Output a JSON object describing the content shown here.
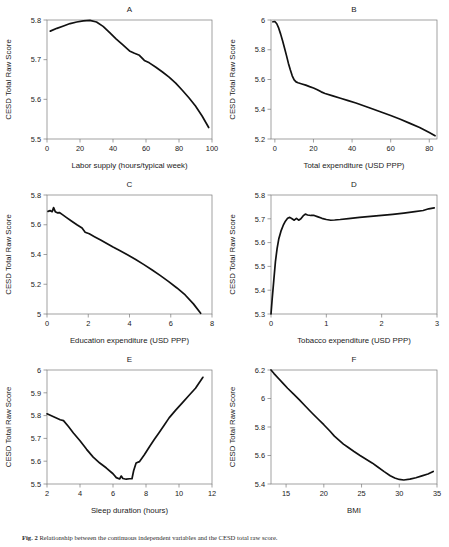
{
  "figure": {
    "caption_label": "Fig. 2",
    "caption_text": "Relationship between the continuous independent variables and the CESD total raw score."
  },
  "shared": {
    "ylabel": "CESD Total Raw Score"
  },
  "chart_data": [
    {
      "type": "line",
      "panel": "A",
      "title": "A",
      "xlabel": "Labor supply (hours/typical week)",
      "ylabel": "CESD Total Raw Score",
      "xlim": [
        0,
        100
      ],
      "ylim": [
        5.5,
        5.8
      ],
      "xticks": [
        0,
        20,
        40,
        60,
        80,
        100
      ],
      "yticks": [
        5.5,
        5.6,
        5.7,
        5.8
      ],
      "ytick_labels": [
        "5.5",
        "5.6",
        "5.7",
        "5.8"
      ],
      "grid": false,
      "legend": "none",
      "x": [
        2,
        6,
        10,
        14,
        18,
        22,
        26,
        30,
        34,
        38,
        42,
        46,
        50,
        53,
        56,
        59,
        62,
        66,
        70,
        74,
        78,
        82,
        86,
        90,
        94,
        98
      ],
      "y": [
        5.772,
        5.779,
        5.785,
        5.791,
        5.795,
        5.798,
        5.799,
        5.795,
        5.784,
        5.768,
        5.752,
        5.737,
        5.722,
        5.716,
        5.711,
        5.698,
        5.692,
        5.681,
        5.669,
        5.656,
        5.641,
        5.623,
        5.604,
        5.583,
        5.558,
        5.529
      ]
    },
    {
      "type": "line",
      "panel": "B",
      "title": "B",
      "xlabel": "Total expenditure (USD PPP)",
      "ylabel": "CESD Total Raw Score",
      "xlim": [
        -2,
        84
      ],
      "ylim": [
        5.2,
        6.0
      ],
      "xticks": [
        0,
        20,
        40,
        60,
        80
      ],
      "yticks": [
        5.2,
        5.4,
        5.6,
        5.8,
        6.0
      ],
      "ytick_labels": [
        "5.2",
        "5.4",
        "5.6",
        "5.8",
        "6"
      ],
      "grid": false,
      "legend": "none",
      "x": [
        -1,
        0,
        1,
        2,
        3,
        4,
        5,
        6,
        7,
        8,
        9,
        10,
        11,
        12,
        14,
        16,
        18,
        20,
        22,
        24,
        26,
        30,
        34,
        38,
        42,
        46,
        50,
        55,
        60,
        65,
        70,
        75,
        80,
        83
      ],
      "y": [
        5.988,
        5.99,
        5.975,
        5.945,
        5.905,
        5.86,
        5.812,
        5.762,
        5.71,
        5.665,
        5.625,
        5.598,
        5.584,
        5.578,
        5.57,
        5.562,
        5.552,
        5.543,
        5.531,
        5.517,
        5.506,
        5.49,
        5.474,
        5.458,
        5.442,
        5.424,
        5.405,
        5.382,
        5.358,
        5.333,
        5.305,
        5.277,
        5.243,
        5.222
      ]
    },
    {
      "type": "line",
      "panel": "C",
      "title": "C",
      "xlabel": "Education expenditure (USD PPP)",
      "ylabel": "CESD Total Raw Score",
      "xlim": [
        0,
        8
      ],
      "ylim": [
        5.0,
        5.8
      ],
      "xticks": [
        0,
        2,
        4,
        6,
        8
      ],
      "yticks": [
        5.0,
        5.2,
        5.4,
        5.6,
        5.8
      ],
      "ytick_labels": [
        "5",
        "5.2",
        "5.4",
        "5.6",
        "5.8"
      ],
      "grid": false,
      "legend": "none",
      "x": [
        0.05,
        0.15,
        0.25,
        0.32,
        0.4,
        0.5,
        0.6,
        0.75,
        0.95,
        1.2,
        1.45,
        1.7,
        1.85,
        2.05,
        2.3,
        2.6,
        2.9,
        3.2,
        3.5,
        3.9,
        4.3,
        4.7,
        5.1,
        5.5,
        5.9,
        6.3,
        6.7,
        7.1,
        7.45
      ],
      "y": [
        5.69,
        5.695,
        5.688,
        5.715,
        5.688,
        5.68,
        5.682,
        5.668,
        5.648,
        5.624,
        5.6,
        5.578,
        5.55,
        5.539,
        5.52,
        5.498,
        5.474,
        5.45,
        5.428,
        5.398,
        5.366,
        5.332,
        5.296,
        5.258,
        5.218,
        5.175,
        5.128,
        5.068,
        5.005
      ]
    },
    {
      "type": "line",
      "panel": "D",
      "title": "D",
      "xlabel": "Tobacco expenditure (USD PPP)",
      "ylabel": "CESD Total Raw Score",
      "xlim": [
        0,
        3
      ],
      "ylim": [
        5.3,
        5.8
      ],
      "xticks": [
        0,
        1,
        2,
        3
      ],
      "yticks": [
        5.3,
        5.4,
        5.5,
        5.6,
        5.7,
        5.8
      ],
      "ytick_labels": [
        "5.3",
        "5.4",
        "5.5",
        "5.6",
        "5.7",
        "5.8"
      ],
      "grid": false,
      "legend": "none",
      "x": [
        0.0,
        0.02,
        0.05,
        0.08,
        0.11,
        0.14,
        0.18,
        0.22,
        0.26,
        0.3,
        0.34,
        0.38,
        0.42,
        0.46,
        0.5,
        0.54,
        0.58,
        0.62,
        0.66,
        0.72,
        0.78,
        0.85,
        0.92,
        1.0,
        1.08,
        1.15,
        1.25,
        1.4,
        1.6,
        1.8,
        2.0,
        2.2,
        2.4,
        2.6,
        2.75,
        2.85,
        2.95
      ],
      "y": [
        5.3,
        5.36,
        5.44,
        5.52,
        5.575,
        5.615,
        5.648,
        5.672,
        5.69,
        5.702,
        5.706,
        5.7,
        5.694,
        5.702,
        5.694,
        5.7,
        5.712,
        5.72,
        5.716,
        5.714,
        5.714,
        5.708,
        5.702,
        5.697,
        5.694,
        5.695,
        5.697,
        5.701,
        5.706,
        5.71,
        5.714,
        5.719,
        5.724,
        5.73,
        5.735,
        5.742,
        5.746
      ]
    },
    {
      "type": "line",
      "panel": "E",
      "title": "E",
      "xlabel": "Sleep duration (hours)",
      "ylabel": "CESD Total Raw Score",
      "xlim": [
        2,
        12
      ],
      "ylim": [
        5.5,
        6.0
      ],
      "xticks": [
        2,
        4,
        6,
        8,
        10,
        12
      ],
      "yticks": [
        5.5,
        5.6,
        5.7,
        5.8,
        5.9,
        6.0
      ],
      "ytick_labels": [
        "5.5",
        "5.6",
        "5.7",
        "5.8",
        "5.9",
        "6"
      ],
      "grid": false,
      "legend": "none",
      "x": [
        2.0,
        2.4,
        2.8,
        3.0,
        3.3,
        3.6,
        4.0,
        4.4,
        4.8,
        5.2,
        5.6,
        6.0,
        6.2,
        6.4,
        6.5,
        6.6,
        6.8,
        7.0,
        7.15,
        7.25,
        7.4,
        7.6,
        7.9,
        8.2,
        8.5,
        8.8,
        9.1,
        9.4,
        9.8,
        10.2,
        10.6,
        11.0,
        11.45
      ],
      "y": [
        5.808,
        5.795,
        5.782,
        5.778,
        5.752,
        5.724,
        5.69,
        5.652,
        5.618,
        5.592,
        5.57,
        5.545,
        5.528,
        5.522,
        5.535,
        5.524,
        5.521,
        5.523,
        5.523,
        5.558,
        5.592,
        5.598,
        5.628,
        5.662,
        5.695,
        5.726,
        5.758,
        5.79,
        5.824,
        5.856,
        5.888,
        5.92,
        5.968
      ]
    },
    {
      "type": "line",
      "panel": "F",
      "title": "F",
      "xlabel": "BMI",
      "ylabel": "CESD Total Raw Score",
      "xlim": [
        13,
        35
      ],
      "ylim": [
        5.4,
        6.2
      ],
      "xticks": [
        15,
        20,
        25,
        30,
        35
      ],
      "yticks": [
        5.4,
        5.6,
        5.8,
        6.0,
        6.2
      ],
      "ytick_labels": [
        "5.4",
        "5.6",
        "5.8",
        "6",
        "6.2"
      ],
      "grid": false,
      "legend": "none",
      "x": [
        13.0,
        13.4,
        14.0,
        14.6,
        15.2,
        16.0,
        16.8,
        17.6,
        18.4,
        19.2,
        20.0,
        20.8,
        21.4,
        22.0,
        22.6,
        23.2,
        24.0,
        24.8,
        25.6,
        26.4,
        27.2,
        28.0,
        28.8,
        29.4,
        30.0,
        30.6,
        31.4,
        32.2,
        33.0,
        33.8,
        34.5
      ],
      "y": [
        6.2,
        6.175,
        6.14,
        6.106,
        6.072,
        6.03,
        5.988,
        5.944,
        5.9,
        5.858,
        5.816,
        5.772,
        5.736,
        5.708,
        5.68,
        5.658,
        5.628,
        5.6,
        5.574,
        5.548,
        5.518,
        5.487,
        5.458,
        5.442,
        5.432,
        5.428,
        5.434,
        5.444,
        5.457,
        5.47,
        5.488
      ]
    }
  ]
}
